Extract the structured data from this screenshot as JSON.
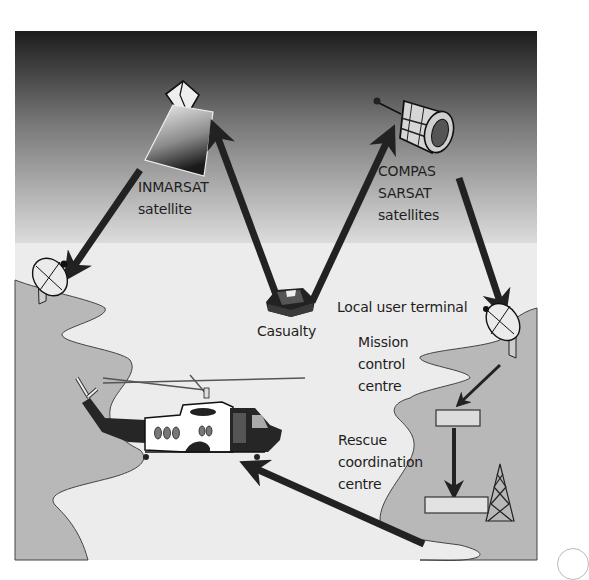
{
  "diagram": {
    "colors": {
      "sky_top": "#1c1c1c",
      "sky_bottom": "#d9d9d9",
      "sea": "#ececec",
      "land": "#b5b5b5",
      "arrow": "#222222"
    },
    "labels": {
      "inmarsat": {
        "line1": "INMARSAT",
        "line2": "satellite"
      },
      "compas": {
        "line1": "COMPAS",
        "line2": "SARSAT",
        "line3": "satellites"
      },
      "casualty": "Casualty",
      "local_user_terminal": "Local user terminal",
      "mission_control": {
        "line1": "Mission",
        "line2": "control",
        "line3": "centre"
      },
      "rescue_coordination": {
        "line1": "Rescue",
        "line2": "coordination",
        "line3": "centre"
      }
    },
    "nodes": [
      {
        "id": "casualty-beacon",
        "icon": "beacon-icon"
      },
      {
        "id": "inmarsat-satellite",
        "icon": "satellite-icon"
      },
      {
        "id": "compas-sarsat-satellite",
        "icon": "satellite-icon"
      },
      {
        "id": "inmarsat-ground-station",
        "icon": "satellite-dish-icon"
      },
      {
        "id": "local-user-terminal",
        "icon": "satellite-dish-icon"
      },
      {
        "id": "mission-control-centre",
        "icon": "building-icon"
      },
      {
        "id": "rescue-coordination-centre",
        "icon": "building-icon"
      },
      {
        "id": "radio-mast",
        "icon": "radio-tower-icon"
      },
      {
        "id": "rescue-helicopter",
        "icon": "helicopter-icon"
      }
    ],
    "edges": [
      {
        "from": "casualty-beacon",
        "to": "inmarsat-satellite"
      },
      {
        "from": "inmarsat-satellite",
        "to": "inmarsat-ground-station"
      },
      {
        "from": "casualty-beacon",
        "to": "compas-sarsat-satellite"
      },
      {
        "from": "compas-sarsat-satellite",
        "to": "local-user-terminal"
      },
      {
        "from": "local-user-terminal",
        "to": "mission-control-centre"
      },
      {
        "from": "mission-control-centre",
        "to": "rescue-coordination-centre"
      },
      {
        "from": "rescue-coordination-centre",
        "to": "rescue-helicopter"
      }
    ]
  }
}
